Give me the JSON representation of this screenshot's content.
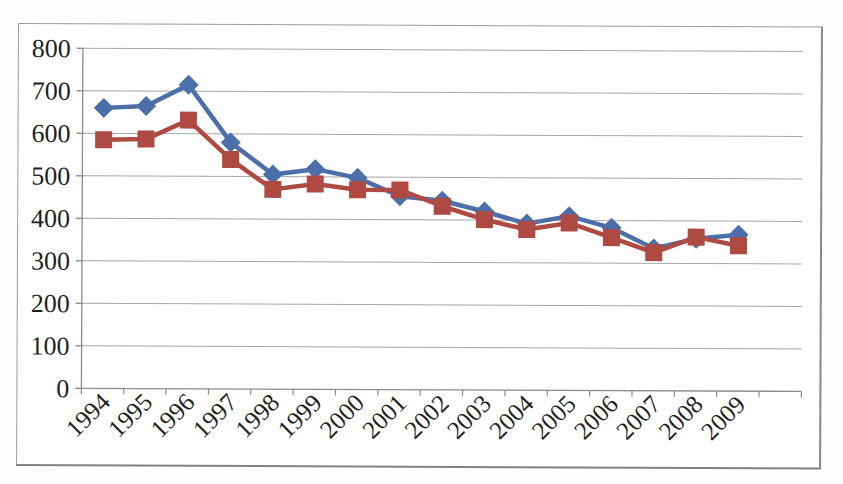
{
  "chart_data": {
    "type": "line",
    "title": "",
    "xlabel": "",
    "ylabel": "",
    "categories": [
      "1994",
      "1995",
      "1996",
      "1997",
      "1998",
      "1999",
      "2000",
      "2001",
      "2002",
      "2003",
      "2004",
      "2005",
      "2006",
      "2007",
      "2008",
      "2009"
    ],
    "series": [
      {
        "name": "series-1-blue-diamonds",
        "marker": "diamond",
        "color": "#4c6fa9",
        "values": [
          660,
          665,
          715,
          580,
          505,
          518,
          498,
          455,
          445,
          420,
          392,
          410,
          383,
          335,
          358,
          368
        ]
      },
      {
        "name": "series-2-red-squares",
        "marker": "square",
        "color": "#af4a42",
        "values": [
          585,
          587,
          632,
          540,
          470,
          483,
          470,
          470,
          432,
          401,
          378,
          394,
          360,
          325,
          362,
          342
        ]
      }
    ],
    "ylim": [
      0,
      800
    ],
    "ytick_step": 100,
    "y_tick_labels_top_to_bottom": [
      "800",
      "700",
      "600",
      "500",
      "400",
      "300",
      "200",
      "100",
      "0"
    ],
    "grid": "horizontal",
    "legend": "none",
    "x_padding_slots": 1,
    "x_label_rotation_deg": -45
  },
  "colors": {
    "series1_blue": "#4c6fa9",
    "series2_red": "#af4a42",
    "gridline": "#a6a6a6",
    "axis_line": "#8c8c8c",
    "tick": "#8c8c8c",
    "label_text": "#1f1f1f",
    "frame_border": "#9b9b9b",
    "background": "#ffffff"
  }
}
